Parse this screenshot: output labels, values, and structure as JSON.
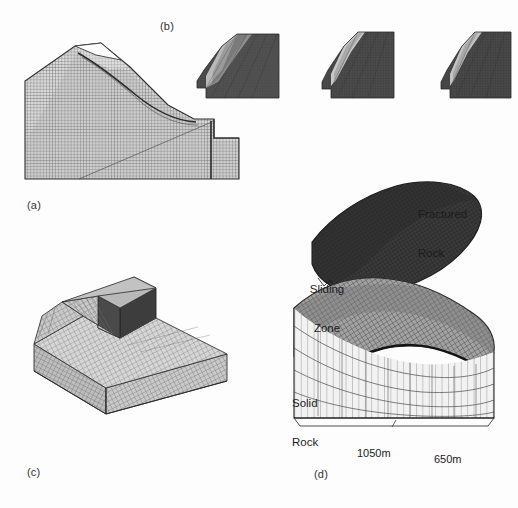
{
  "figure": {
    "background_color": "#fdfdfd",
    "ink_color": "#1c1c1c",
    "caption_color": "#333333"
  },
  "panels": {
    "a": {
      "caption": "(a)",
      "kind": "2d-fem-mesh-cross-section",
      "description": "Two dimensional finite element mesh of a slope cross-section with a curved slip surface and a vertical discontinuity near the toe.",
      "mesh_color": "#6b6b6b",
      "fill_color": "#cfcfcf"
    },
    "b": {
      "caption": "(b)",
      "kind": "deformation-snapshot-series",
      "description": "Three shaded snapshots of the slope crest showing progressive failure and displacement of the sliding mass.",
      "frame_count": 3,
      "dark_color": "#4a4a4a",
      "light_color": "#cbcbcb"
    },
    "c": {
      "caption": "(c)",
      "kind": "3d-block-mesh",
      "description": "Three dimensional block model of the slope with a structured hexahedral mesh and a dark excavated face.",
      "mesh_color": "#777777",
      "face_light": "#d2d2d2",
      "face_mid": "#b3b3b3",
      "face_dark": "#3d3d3d"
    },
    "d": {
      "caption": "(d)",
      "kind": "3d-exploded-layers",
      "description": "Exploded three dimensional view separating the fractured rock lens, the sliding zone surface and the solid rock foundation mesh.",
      "labels": [
        {
          "id": "fractured-rock",
          "text": "Fractured\nRock",
          "line1": "Fractured",
          "line2": "Rock"
        },
        {
          "id": "sliding-zone",
          "text": "Sliding\nZone",
          "line1": "Sliding",
          "line2": "Zone"
        },
        {
          "id": "solid-rock",
          "text": "Solid\nRock",
          "line1": "Solid",
          "line2": "Rock"
        }
      ],
      "dimensions": [
        {
          "id": "width-front",
          "value": "1050m"
        },
        {
          "id": "width-side",
          "value": "650m"
        }
      ],
      "fractured_color": "#3a3a3a",
      "sliding_color": "#8e8e8e",
      "solid_color": "#ededed"
    }
  }
}
